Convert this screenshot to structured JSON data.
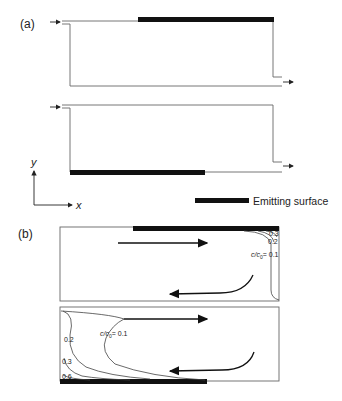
{
  "panel_a": {
    "label": "(a)",
    "top_channel": {
      "emitting_surface": "top wall (downstream portion)"
    },
    "bottom_channel": {
      "emitting_surface": "bottom wall (upstream portion)"
    }
  },
  "axes": {
    "x_label": "x",
    "y_label": "y"
  },
  "legend": {
    "emitting_surface_label": "Emitting surface"
  },
  "panel_b": {
    "label": "(b)",
    "top_cavity": {
      "contour_labels": [
        "0.3",
        "0.2",
        "c/c₀ = 0.1"
      ],
      "contour_label_parts": {
        "c": "c/c",
        "sub": "0",
        "rest": "= 0.1"
      }
    },
    "bottom_cavity": {
      "contour_labels": [
        "c/c₀ = 0.1",
        "0.2",
        "0.3",
        "0.6"
      ],
      "contour_label_parts": {
        "c": "c/c",
        "sub": "0",
        "rest": "= 0.1"
      }
    }
  },
  "colors": {
    "line": "#555555",
    "bar": "#111111",
    "text": "#222222"
  }
}
